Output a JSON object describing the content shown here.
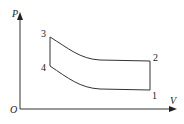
{
  "diagram": {
    "type": "pV-cycle",
    "axes": {
      "y_label": "P",
      "x_label": "V",
      "origin_label": "O"
    },
    "points": [
      {
        "id": "1",
        "label": "1"
      },
      {
        "id": "2",
        "label": "2"
      },
      {
        "id": "3",
        "label": "3"
      },
      {
        "id": "4",
        "label": "4"
      }
    ],
    "processes": [
      {
        "from": "1",
        "to": "2",
        "kind": "isochoric (vertical)"
      },
      {
        "from": "2",
        "to": "3",
        "kind": "curve"
      },
      {
        "from": "3",
        "to": "4",
        "kind": "isochoric (vertical)"
      },
      {
        "from": "4",
        "to": "1",
        "kind": "curve"
      }
    ],
    "colors": {
      "line": "#333333",
      "background": "#ffffff"
    }
  }
}
